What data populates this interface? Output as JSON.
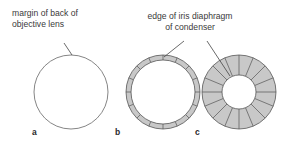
{
  "figure": {
    "annotations": {
      "objective_margin": {
        "line1": "margin of back of",
        "line2": "objective lens"
      },
      "iris_edge": {
        "line1": "edge of iris diaphragm",
        "line2": "of condenser"
      }
    },
    "panels": [
      {
        "letter": "a",
        "description": "open circle: back of objective lens, iris fully open",
        "outer_radius": 37,
        "inner_radius": 37,
        "segments": 0
      },
      {
        "letter": "b",
        "description": "thin shaded ring: iris diaphragm slightly closed",
        "outer_radius": 37,
        "inner_radius": 32,
        "segments": 16
      },
      {
        "letter": "c",
        "description": "thick shaded ring: iris diaphragm stopped down",
        "outer_radius": 37,
        "inner_radius": 17,
        "segments": 16
      }
    ],
    "colors": {
      "ring_fill": "#c8c8c8",
      "stroke": "#555555",
      "text": "#3a3a3a",
      "background": "#ffffff"
    }
  }
}
